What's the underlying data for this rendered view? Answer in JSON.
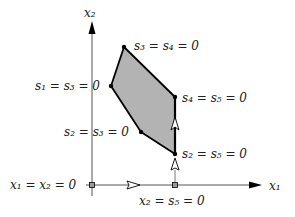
{
  "diagram": {
    "type": "simplex-path-polytope",
    "axes": {
      "x_label": "x₁",
      "y_label": "x₂",
      "origin_label": "x₁ = x₂ = 0"
    },
    "polygon": {
      "fill": "#b3b3b3",
      "stroke": "#000000",
      "vertices": [
        {
          "id": "top",
          "label": "s₃ = s₄ = 0"
        },
        {
          "id": "left",
          "label": "s₁ = s₃ = 0"
        },
        {
          "id": "bottom-left",
          "label": "s₂ = s₃ = 0"
        },
        {
          "id": "bottom-right",
          "label": "s₂ = s₅ = 0"
        },
        {
          "id": "right",
          "label": "s₄ = s₅ = 0"
        }
      ]
    },
    "axis_point": {
      "label": "x₂ = s₅ = 0"
    },
    "path_arrows": [
      {
        "from": "origin",
        "to": "x₂ = s₅ = 0",
        "direction": "right"
      },
      {
        "from": "x₂ = s₅ = 0",
        "to": "s₂ = s₅ = 0",
        "direction": "up"
      },
      {
        "from": "s₂ = s₅ = 0",
        "to": "s₄ = s₅ = 0",
        "direction": "up"
      }
    ]
  }
}
